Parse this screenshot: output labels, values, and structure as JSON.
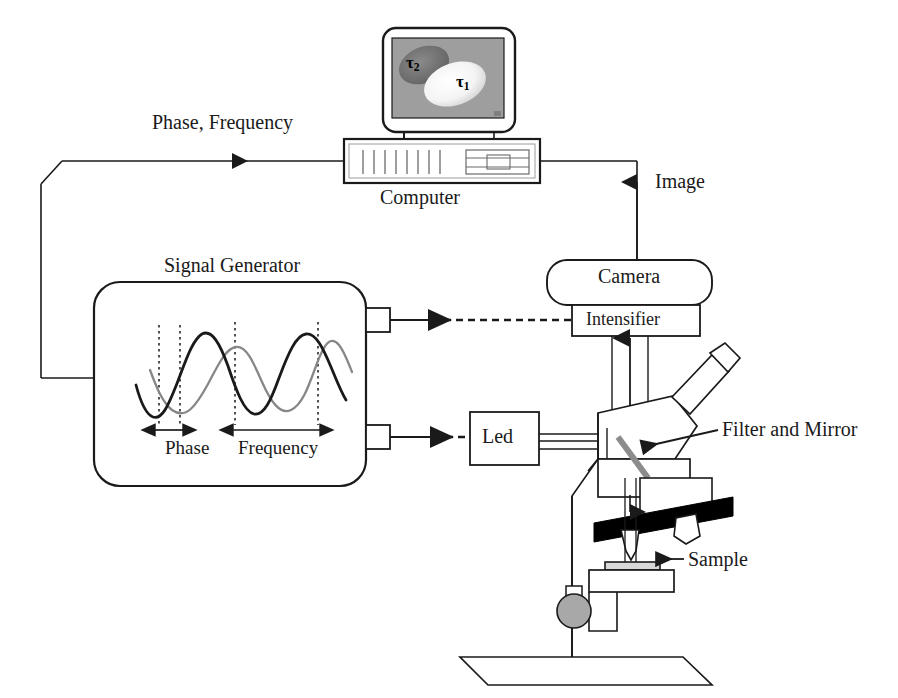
{
  "figure": {
    "type": "schematic-diagram",
    "background_color": "#ffffff",
    "line_color": "#1a1a1a"
  },
  "labels": {
    "phase_frequency": "Phase, Frequency",
    "computer": "Computer",
    "image": "Image",
    "signal_generator": "Signal Generator",
    "camera": "Camera",
    "intensifier": "Intensifier",
    "led": "Led",
    "filter_and_mirror": "Filter and Mirror",
    "sample": "Sample",
    "phase": "Phase",
    "frequency": "Frequency"
  },
  "monitor": {
    "screen_background": "#9e9e9e",
    "blob_tau2_label": "τ",
    "blob_tau2_sub": "2",
    "blob_tau2_color": "#6e6e6e",
    "blob_tau1_label": "τ",
    "blob_tau1_sub": "1",
    "blob_tau1_color": "#f2f2f2"
  },
  "waveform": {
    "wave_1_color": "#1a1a1a",
    "wave_1_name": "reference-wave",
    "wave_2_color": "#7d7d7d",
    "wave_2_name": "phase-shifted-wave",
    "dotted_guides": 4,
    "phase_marker": "Phase",
    "frequency_marker": "Frequency"
  },
  "connections": [
    {
      "name": "computer-to-signal-generator",
      "label": "Phase, Frequency",
      "style": "solid",
      "direction": "left"
    },
    {
      "name": "camera-to-computer",
      "label": "Image",
      "style": "solid",
      "direction": "up"
    },
    {
      "name": "signal-generator-to-intensifier",
      "label": "",
      "style": "dashed",
      "direction": "right"
    },
    {
      "name": "signal-generator-to-led",
      "label": "",
      "style": "dashed",
      "direction": "right"
    }
  ],
  "colors": {
    "turret_black": "#000000",
    "knob_grey": "#9a9a9a",
    "mirror_grey": "#8c8c8c"
  }
}
